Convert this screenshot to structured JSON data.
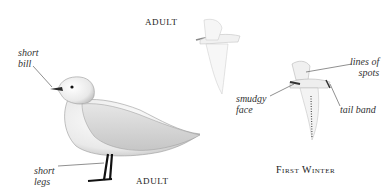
{
  "captions": {
    "adult_flying": "ADULT",
    "adult_standing": "ADULT",
    "first_winter": "First Winter"
  },
  "labels": {
    "short_bill": [
      "short",
      "bill"
    ],
    "short_legs": [
      "short",
      "legs"
    ],
    "lines_of_spots": [
      "lines of",
      "spots"
    ],
    "smudgy_face": [
      "smudgy",
      "face"
    ],
    "tail_band": "tail band"
  },
  "figures": [
    {
      "name": "standing-adult",
      "description": "standing adult gull, white with grey back, dark bill and black legs"
    },
    {
      "name": "flying-adult",
      "description": "flying adult from above, pale"
    },
    {
      "name": "flying-first-winter",
      "description": "first-winter bird in flight with spots, smudgy face and tail band"
    }
  ]
}
